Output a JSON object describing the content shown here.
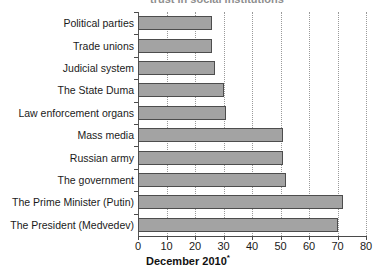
{
  "title_clipped": "trust in social institutions",
  "axis_caption": "December 2010",
  "axis_caption_marker": "*",
  "chart_data": {
    "type": "bar",
    "orientation": "horizontal",
    "title": "",
    "xlabel": "December 2010*",
    "ylabel": "",
    "xlim": [
      0,
      80
    ],
    "xticks": [
      0,
      10,
      20,
      30,
      40,
      50,
      60,
      70,
      80
    ],
    "grid": true,
    "grid_axis": "x",
    "legend": false,
    "bar_color": "#a3a3a3",
    "bar_border_color": "#4d4d4d",
    "categories": [
      "Political parties",
      "Trade unions",
      "Judicial system",
      "The State Duma",
      "Law enforcement organs",
      "Mass media",
      "Russian army",
      "The government",
      "The Prime Minister (Putin)",
      "The President (Medvedev)"
    ],
    "values": [
      26,
      26,
      27,
      30,
      31,
      51,
      51,
      52,
      72,
      70
    ]
  }
}
